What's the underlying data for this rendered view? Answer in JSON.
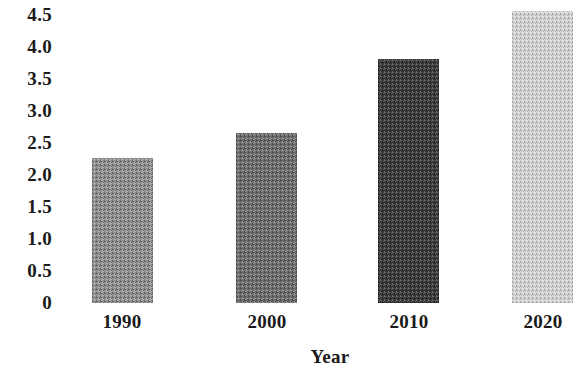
{
  "chart_data": {
    "type": "bar",
    "title": "",
    "subtitle": "",
    "xlabel": "Year",
    "ylabel": "",
    "categories": [
      "1990",
      "2000",
      "2010",
      "2020"
    ],
    "values": [
      2.25,
      2.65,
      3.8,
      4.55
    ],
    "series": [
      {
        "name": "",
        "values": [
          2.25,
          2.65,
          3.8,
          4.55
        ]
      }
    ],
    "ylim": [
      0,
      4.5
    ],
    "yticks": [
      "4.5",
      "4.0",
      "3.5",
      "3.0",
      "2.5",
      "2.0",
      "1.5",
      "1.0",
      "0.5",
      "0"
    ],
    "ytick_values": [
      4.5,
      4.0,
      3.5,
      3.0,
      2.5,
      2.0,
      1.5,
      1.0,
      0.5,
      0
    ],
    "grid": false,
    "legend": false,
    "legend_position": "none",
    "annotations": [],
    "bar_colors": [
      "#8f8f8f",
      "#6f6f6f",
      "#3c3c3c",
      "#d2d2d2"
    ],
    "bar_fill_styles": [
      "medium-gray-dither",
      "medium-dark-gray-dither",
      "dark-gray-dither",
      "light-gray-dither"
    ],
    "background_color": "#ffffff",
    "text_color": "#1a1a1a"
  }
}
